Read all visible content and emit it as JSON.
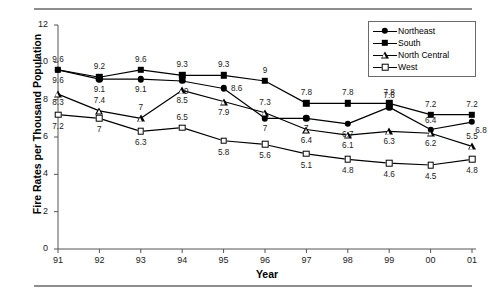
{
  "figure": {
    "has_top_rule": true,
    "has_bottom_rule": true
  },
  "axes": {
    "y_title": "Fire Rates per Thousand Population",
    "x_title": "Year",
    "y_ticks": [
      "0",
      "2",
      "4",
      "6",
      "8",
      "10",
      "12"
    ],
    "x_ticks": [
      "91",
      "92",
      "93",
      "94",
      "95",
      "96",
      "97",
      "98",
      "99",
      "00",
      "01"
    ]
  },
  "legend": {
    "position": "top-right",
    "items": [
      {
        "label": "Northeast",
        "marker": "filled-circle"
      },
      {
        "label": "South",
        "marker": "filled-square"
      },
      {
        "label": "North Central",
        "marker": "open-triangle"
      },
      {
        "label": "West",
        "marker": "open-square"
      }
    ]
  },
  "colors": {
    "line": "#000000",
    "marker_fill": "#000000",
    "marker_open_fill": "#ffffff",
    "rule": "#8d8d8d",
    "axis": "#555555",
    "text": "#000000"
  },
  "chart_data": {
    "type": "line",
    "title": "",
    "xlabel": "Year",
    "ylabel": "Fire Rates per Thousand Population",
    "categories": [
      "91",
      "92",
      "93",
      "94",
      "95",
      "96",
      "97",
      "98",
      "99",
      "00",
      "01"
    ],
    "ylim": [
      0,
      12
    ],
    "ytick_step": 2,
    "grid": false,
    "legend_position": "top-right",
    "data_labels": true,
    "series": [
      {
        "name": "Northeast",
        "marker": "filled-circle",
        "values": [
          9.6,
          9.1,
          9.1,
          9,
          8.6,
          7,
          7,
          6.7,
          7.6,
          6.4,
          6.8
        ],
        "labels": [
          "9.6",
          "9.1",
          "9.1",
          "9",
          "8.6",
          "7",
          "7",
          "6.7",
          "7.6",
          "6.4",
          "6.8"
        ]
      },
      {
        "name": "South",
        "marker": "filled-square",
        "values": [
          9.6,
          9.2,
          9.6,
          9.3,
          9.3,
          9,
          7.8,
          7.8,
          7.8,
          7.2,
          7.2
        ],
        "labels": [
          "9.6",
          "9.2",
          "9.6",
          "9.3",
          "9.3",
          "9",
          "7.8",
          "7.8",
          "7.8",
          "7.2",
          "7.2"
        ]
      },
      {
        "name": "North Central",
        "marker": "open-triangle",
        "values": [
          8.3,
          7.4,
          7,
          8.5,
          7.9,
          7.3,
          6.4,
          6.1,
          6.3,
          6.2,
          5.5
        ],
        "labels": [
          "8.3",
          "7.4",
          "7",
          "8.5",
          "7.9",
          "7.3",
          "6.4",
          "6.1",
          "6.3",
          "6.2",
          "5.5"
        ]
      },
      {
        "name": "West",
        "marker": "open-square",
        "values": [
          7.2,
          7,
          6.3,
          6.5,
          5.8,
          5.6,
          5.1,
          4.8,
          4.6,
          4.5,
          4.8
        ],
        "labels": [
          "7.2",
          "7",
          "6.3",
          "6.5",
          "5.8",
          "5.6",
          "5.1",
          "4.8",
          "4.6",
          "4.5",
          "4.8"
        ]
      }
    ]
  }
}
